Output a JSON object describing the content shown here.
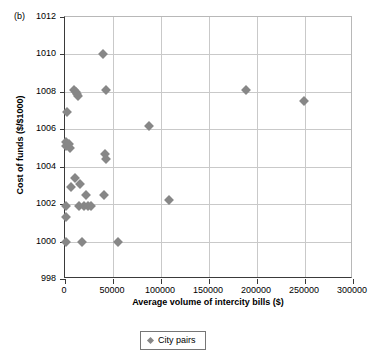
{
  "panel": {
    "label": "(b)"
  },
  "chart_data": {
    "type": "scatter",
    "title": "",
    "xlabel": "Average volume of intercity bills ($)",
    "ylabel": "Cost of funds ($/$1000)",
    "xlim": [
      0,
      300000
    ],
    "ylim": [
      998,
      1012
    ],
    "xticks": [
      0,
      50000,
      100000,
      150000,
      200000,
      250000,
      300000
    ],
    "xtick_labels": [
      "0",
      "50000",
      "100000",
      "150000",
      "200000",
      "250000",
      "300000"
    ],
    "yticks": [
      998,
      1000,
      1002,
      1004,
      1006,
      1008,
      1010,
      1012
    ],
    "ytick_labels": [
      "998",
      "1000",
      "1002",
      "1004",
      "1006",
      "1008",
      "1010",
      "1012"
    ],
    "grid": "both",
    "legend_position": "below-center",
    "marker_color": "#878787",
    "marker_shape": "diamond",
    "series": [
      {
        "name": "City pairs",
        "points": [
          [
            1000,
            1000.0
          ],
          [
            1000,
            1001.3
          ],
          [
            1000,
            1001.9
          ],
          [
            1000,
            1005.3
          ],
          [
            1000,
            1005.1
          ],
          [
            2500,
            1006.9
          ],
          [
            4000,
            1005.2
          ],
          [
            5000,
            1005.0
          ],
          [
            6000,
            1002.9
          ],
          [
            9000,
            1008.1
          ],
          [
            10000,
            1003.4
          ],
          [
            11000,
            1008.0
          ],
          [
            13000,
            1007.9
          ],
          [
            14000,
            1007.8
          ],
          [
            15000,
            1001.9
          ],
          [
            16000,
            1003.1
          ],
          [
            18000,
            1000.0
          ],
          [
            20000,
            1001.9
          ],
          [
            22000,
            1002.5
          ],
          [
            24000,
            1001.9
          ],
          [
            27000,
            1001.9
          ],
          [
            40000,
            1010.0
          ],
          [
            41000,
            1002.5
          ],
          [
            42000,
            1004.7
          ],
          [
            42500,
            1004.4
          ],
          [
            43000,
            1008.1
          ],
          [
            55000,
            1000.0
          ],
          [
            87000,
            1006.2
          ],
          [
            108000,
            1002.2
          ],
          [
            189000,
            1008.1
          ],
          [
            249000,
            1007.5
          ]
        ]
      }
    ]
  },
  "legend": {
    "entries": [
      {
        "label": "City pairs"
      }
    ]
  }
}
